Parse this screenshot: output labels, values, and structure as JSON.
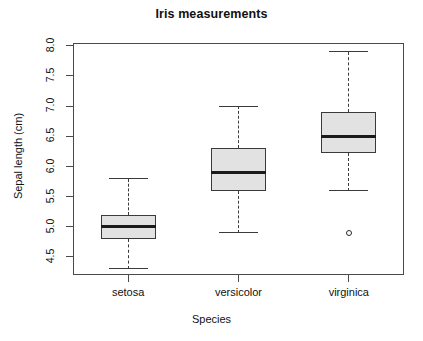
{
  "chart_data": {
    "type": "box",
    "title": "Iris measurements",
    "xlabel": "Species",
    "ylabel": "Sepal length (cm)",
    "categories": [
      "setosa",
      "versicolor",
      "virginica"
    ],
    "ylim": [
      4.2,
      8.05
    ],
    "yticks": [
      4.5,
      5.0,
      5.5,
      6.0,
      6.5,
      7.0,
      7.5,
      8.0
    ],
    "ytick_labels": [
      "4.5",
      "5.0",
      "5.5",
      "6.0",
      "6.5",
      "7.0",
      "7.5",
      "8.0"
    ],
    "grid": false,
    "legend": "none",
    "box_fill": "#e2e2e2",
    "line_color": "#3a3a3a",
    "boxes": [
      {
        "name": "setosa",
        "whisker_low": 4.3,
        "q1": 4.8,
        "median": 5.0,
        "q3": 5.2,
        "whisker_high": 5.8,
        "outliers": []
      },
      {
        "name": "versicolor",
        "whisker_low": 4.9,
        "q1": 5.6,
        "median": 5.9,
        "q3": 6.3,
        "whisker_high": 7.0,
        "outliers": []
      },
      {
        "name": "virginica",
        "whisker_low": 5.6,
        "q1": 6.225,
        "median": 6.5,
        "q3": 6.9,
        "whisker_high": 7.9,
        "outliers": [
          4.9
        ]
      }
    ]
  }
}
